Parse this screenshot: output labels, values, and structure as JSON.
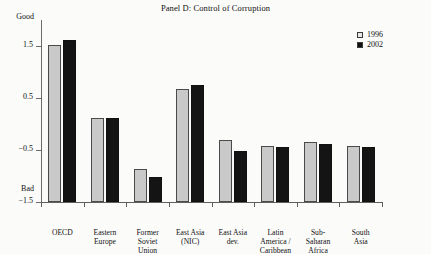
{
  "chart_data": {
    "type": "bar",
    "title": "Panel D: Control of Corruption",
    "xlabel": "",
    "ylabel": "",
    "ylim": [
      -1.5,
      2.0
    ],
    "yticks": [
      1.5,
      0.5,
      -0.5,
      -1.5
    ],
    "ytick_labels": [
      "1.5",
      "0.5",
      "−0.5",
      "−1.5"
    ],
    "y_top_label": "Good",
    "y_bottom_label": "Bad",
    "grid": false,
    "legend_position": "top-right",
    "categories": [
      "OECD",
      "Eastern Europe",
      "Former Soviet Union",
      "East Asia (NIC)",
      "East Asia dev.",
      "Latin America / Caribbean",
      "Sub-Saharan Africa",
      "South Asia"
    ],
    "category_label_lines": [
      [
        "OECD"
      ],
      [
        "Eastern",
        "Europe"
      ],
      [
        "Former",
        "Soviet",
        "Union"
      ],
      [
        "East Asia",
        "(NIC)"
      ],
      [
        "East Asia",
        "dev."
      ],
      [
        "Latin",
        "America /",
        "Caribbean"
      ],
      [
        "Sub-",
        "Saharan",
        "Africa"
      ],
      [
        "South",
        "Asia"
      ]
    ],
    "series": [
      {
        "name": "1996",
        "color": "#c9c9c9",
        "values": [
          1.52,
          0.12,
          -0.87,
          0.68,
          -0.3,
          -0.42,
          -0.35,
          -0.42
        ]
      },
      {
        "name": "2002",
        "color": "#141414",
        "values": [
          1.62,
          0.12,
          -1.02,
          0.75,
          -0.52,
          -0.45,
          -0.38,
          -0.45
        ]
      }
    ]
  },
  "legend": {
    "items": [
      {
        "label": "1996",
        "swatch": "light-square-swatch"
      },
      {
        "label": "2002",
        "swatch": "dark-square-swatch"
      }
    ]
  }
}
